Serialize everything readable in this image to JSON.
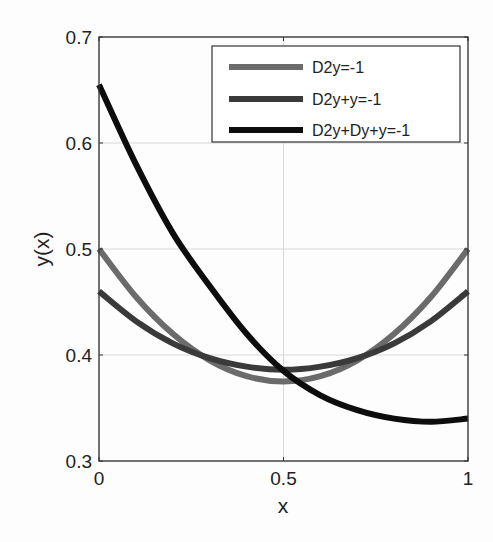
{
  "chart_data": {
    "type": "line",
    "title": "",
    "xlabel": "x",
    "ylabel": "y(x)",
    "xlim": [
      0,
      1
    ],
    "ylim": [
      0.3,
      0.7
    ],
    "xticks": [
      "0",
      "0.5",
      "1"
    ],
    "yticks": [
      "0.3",
      "0.4",
      "0.5",
      "0.6",
      "0.7"
    ],
    "grid": true,
    "legend_position": "upper right",
    "x": [
      0,
      0.1,
      0.2,
      0.3,
      0.4,
      0.5,
      0.6,
      0.7,
      0.8,
      0.9,
      1.0
    ],
    "series": [
      {
        "name": "D2y=-1",
        "color": "#6b6b6b",
        "values": [
          0.5,
          0.455,
          0.42,
          0.395,
          0.38,
          0.375,
          0.38,
          0.395,
          0.42,
          0.455,
          0.5
        ]
      },
      {
        "name": "D2y+y=-1",
        "color": "#3a3a3a",
        "values": [
          0.46,
          0.432,
          0.411,
          0.397,
          0.389,
          0.386,
          0.389,
          0.397,
          0.411,
          0.432,
          0.46
        ]
      },
      {
        "name": "D2y+Dy+y=-1",
        "color": "#0d0d0d",
        "values": [
          0.655,
          0.58,
          0.515,
          0.465,
          0.42,
          0.385,
          0.362,
          0.348,
          0.34,
          0.337,
          0.34
        ]
      }
    ]
  },
  "legend": {
    "items": [
      "D2y=-1",
      "D2y+y=-1",
      "D2y+Dy+y=-1"
    ]
  },
  "axes": {
    "xlabel": "x",
    "ylabel": "y(x)",
    "xticks": [
      "0",
      "0.5",
      "1"
    ],
    "yticks": [
      "0.3",
      "0.4",
      "0.5",
      "0.6",
      "0.7"
    ]
  }
}
